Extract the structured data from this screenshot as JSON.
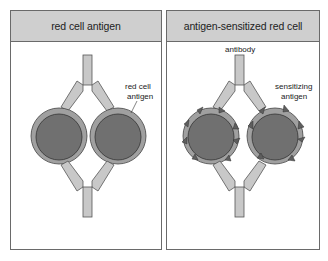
{
  "panels": [
    {
      "title": "red cell antigen",
      "labels": {
        "antigen_line1": "red cell",
        "antigen_line2": "antigen"
      }
    },
    {
      "title": "antigen-sensitized red cell",
      "labels": {
        "antibody": "antibody",
        "sensitizing_line1": "sensitizing",
        "sensitizing_line2": "antigen"
      }
    }
  ],
  "colors": {
    "header_bg": "#cfcfcf",
    "cell_outer": "#a0a0a0",
    "cell_inner": "#707070",
    "antibody": "#c8c8c8",
    "antigen_triangle": "#5e5e5e",
    "border": "#6a6a6a"
  }
}
